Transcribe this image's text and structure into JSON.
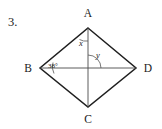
{
  "problem": {
    "number": "3."
  },
  "figure": {
    "shape_name": "rhombus",
    "vertices": [
      {
        "id": "A",
        "label": "A",
        "x": 88,
        "y": 28,
        "label_x": 88,
        "label_y": 17
      },
      {
        "id": "B",
        "label": "B",
        "x": 40,
        "y": 68,
        "label_x": 28,
        "label_y": 72
      },
      {
        "id": "C",
        "label": "C",
        "x": 88,
        "y": 107,
        "label_x": 88,
        "label_y": 123
      },
      {
        "id": "D",
        "label": "D",
        "x": 136,
        "y": 68,
        "label_x": 148,
        "label_y": 72
      }
    ],
    "edges": [
      {
        "from": "A",
        "to": "B"
      },
      {
        "from": "B",
        "to": "C"
      },
      {
        "from": "C",
        "to": "D"
      },
      {
        "from": "D",
        "to": "A"
      }
    ],
    "diagonals": [
      {
        "from": "A",
        "to": "C"
      },
      {
        "from": "B",
        "to": "D"
      }
    ],
    "center": {
      "x": 88,
      "y": 68
    },
    "angle_labels": [
      {
        "id": "angle-b",
        "text": "38°",
        "at_vertex": "B",
        "label_x": 53,
        "label_y": 68,
        "arc": "M 53 62.5 A 14 14 0 0 0 54 73.5"
      },
      {
        "id": "angle-x",
        "text": "x",
        "at_vertex": "A",
        "label_x": 81,
        "label_y": 46,
        "arc": "M 79.5 39.5 A 13 13 0 0 0 88 41"
      },
      {
        "id": "angle-y",
        "text": "y",
        "at_vertex": "center",
        "label_x": 98,
        "label_y": 58,
        "arc": "M 88 55 A 13 13 0 0 1 101 68"
      }
    ],
    "colors": {
      "edge": "#1f1f1f",
      "diagonal": "#4a4a4a",
      "arc": "#555555",
      "text": "#1a1a1a",
      "background": "#ffffff"
    }
  }
}
